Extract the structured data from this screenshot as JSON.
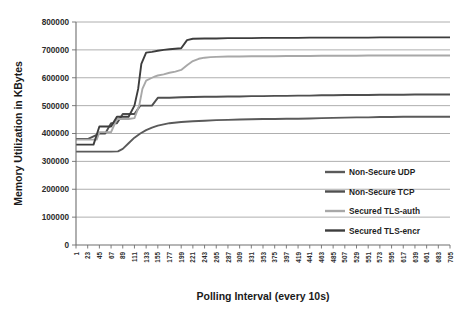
{
  "chart_data": {
    "type": "line",
    "title": "",
    "xlabel": "Polling Interval (every 10s)",
    "ylabel": "Memory Utilization in KBytes",
    "ylim": [
      0,
      800000
    ],
    "ytick_labels": [
      "800000",
      "700000",
      "600000",
      "500000",
      "400000",
      "300000",
      "200000",
      "100000",
      "0"
    ],
    "ytick_values": [
      800000,
      700000,
      600000,
      500000,
      400000,
      300000,
      200000,
      100000,
      0
    ],
    "xlim": [
      1,
      705
    ],
    "xtick_labels": [
      "1",
      "23",
      "45",
      "67",
      "89",
      "111",
      "133",
      "155",
      "177",
      "199",
      "221",
      "243",
      "265",
      "287",
      "309",
      "331",
      "353",
      "375",
      "397",
      "419",
      "441",
      "463",
      "485",
      "507",
      "529",
      "551",
      "573",
      "595",
      "617",
      "639",
      "661",
      "683",
      "705"
    ],
    "grid": "horizontal",
    "legend_position": "inside-right",
    "legend": [
      "Non-Secure UDP",
      "Non-Secure TCP",
      "Secured TLS-auth",
      "Secured TLS-encr"
    ],
    "series": [
      {
        "name": "Non-Secure UDP",
        "color": "#5a5a5a",
        "x": [
          1,
          23,
          45,
          67,
          80,
          89,
          100,
          111,
          122,
          133,
          144,
          155,
          177,
          199,
          221,
          243,
          265,
          287,
          309,
          331,
          353,
          375,
          397,
          419,
          441,
          463,
          485,
          507,
          529,
          551,
          573,
          595,
          617,
          639,
          661,
          683,
          705
        ],
        "values": [
          335000,
          335000,
          335000,
          335000,
          336000,
          345000,
          365000,
          385000,
          400000,
          412000,
          421000,
          428000,
          437000,
          441000,
          444000,
          446000,
          448000,
          449000,
          450000,
          451000,
          452000,
          452000,
          453000,
          453000,
          454000,
          455000,
          456000,
          457000,
          458000,
          458000,
          459000,
          459000,
          460000,
          460000,
          460000,
          460000,
          460000
        ]
      },
      {
        "name": "Non-Secure TCP",
        "color": "#4f4f4f",
        "x": [
          1,
          23,
          34,
          45,
          56,
          67,
          78,
          89,
          100,
          111,
          122,
          133,
          144,
          155,
          177,
          199,
          221,
          243,
          265,
          287,
          309,
          331,
          353,
          375,
          397,
          419,
          441,
          463,
          485,
          507,
          529,
          551,
          573,
          595,
          617,
          639,
          661,
          683,
          705
        ],
        "values": [
          380000,
          380000,
          390000,
          400000,
          400000,
          437000,
          437000,
          470000,
          470000,
          470000,
          500000,
          500000,
          500000,
          528000,
          528000,
          530000,
          531000,
          532000,
          532000,
          533000,
          533000,
          534000,
          534000,
          535000,
          535000,
          536000,
          536000,
          537000,
          537000,
          538000,
          538000,
          538000,
          539000,
          539000,
          539000,
          540000,
          540000,
          540000,
          540000
        ]
      },
      {
        "name": "Secured TLS-auth",
        "color": "#a8a8a8",
        "x": [
          1,
          23,
          40,
          45,
          56,
          67,
          78,
          89,
          100,
          111,
          120,
          126,
          133,
          144,
          150,
          155,
          166,
          177,
          188,
          199,
          210,
          221,
          232,
          243,
          254,
          265,
          287,
          309,
          331,
          353,
          375,
          397,
          419,
          441,
          463,
          485,
          507,
          529,
          551,
          573,
          595,
          617,
          639,
          661,
          683,
          705
        ],
        "values": [
          378000,
          378000,
          378000,
          405000,
          405000,
          405000,
          452000,
          452000,
          452000,
          455000,
          500000,
          560000,
          590000,
          600000,
          605000,
          608000,
          612000,
          618000,
          622000,
          628000,
          645000,
          660000,
          668000,
          672000,
          674000,
          675000,
          676000,
          676000,
          677000,
          677000,
          677000,
          678000,
          678000,
          678000,
          679000,
          679000,
          679000,
          679000,
          680000,
          680000,
          680000,
          680000,
          680000,
          680000,
          680000,
          680000
        ]
      },
      {
        "name": "Secured TLS-encr",
        "color": "#3d3d3d",
        "x": [
          1,
          23,
          34,
          45,
          56,
          67,
          78,
          89,
          100,
          111,
          118,
          124,
          133,
          144,
          155,
          166,
          177,
          188,
          199,
          210,
          221,
          243,
          265,
          287,
          309,
          331,
          353,
          375,
          397,
          419,
          441,
          463,
          485,
          507,
          529,
          551,
          573,
          595,
          617,
          639,
          661,
          683,
          705
        ],
        "values": [
          360000,
          360000,
          360000,
          425000,
          425000,
          425000,
          460000,
          460000,
          460000,
          500000,
          560000,
          650000,
          690000,
          693000,
          697000,
          700000,
          702000,
          704000,
          706000,
          735000,
          740000,
          741000,
          741000,
          742000,
          742000,
          742000,
          743000,
          743000,
          743000,
          743000,
          744000,
          744000,
          744000,
          744000,
          744000,
          744000,
          745000,
          745000,
          745000,
          745000,
          745000,
          745000,
          745000
        ]
      }
    ]
  }
}
